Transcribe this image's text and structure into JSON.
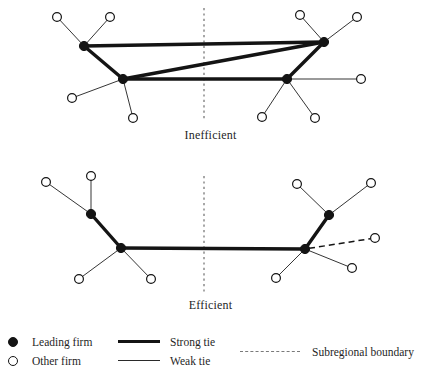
{
  "figure": {
    "panels": [
      {
        "id": "inefficient",
        "label": "Inefficient"
      },
      {
        "id": "efficient",
        "label": "Efficient"
      }
    ]
  },
  "legend": {
    "firms": [
      {
        "symbol": "filled-circle",
        "label": "Leading firm"
      },
      {
        "symbol": "open-circle",
        "label": "Other firm"
      }
    ],
    "ties": [
      {
        "symbol": "thick-line",
        "label": "Strong tie"
      },
      {
        "symbol": "thin-line",
        "label": "Weak tie"
      }
    ],
    "boundary": [
      {
        "symbol": "dashed-line",
        "label": "Subregional boundary"
      }
    ]
  },
  "colors": {
    "ink": "#141414",
    "weak_tie": "#2a2a2a",
    "boundary": "#8a8a8a",
    "background": "#ffffff"
  },
  "diagram_data": {
    "type": "network",
    "panels": [
      {
        "id": "inefficient",
        "title": "Inefficient",
        "boundary": {
          "x": 204,
          "y1": 8,
          "y2": 121,
          "style": "dashed"
        },
        "leading_firms": [
          {
            "id": "L1",
            "x": 84,
            "y": 46
          },
          {
            "id": "L2",
            "x": 123,
            "y": 79
          },
          {
            "id": "L3",
            "x": 324,
            "y": 42
          },
          {
            "id": "L4",
            "x": 287,
            "y": 79
          }
        ],
        "other_firms": [
          {
            "id": "o1",
            "x": 57,
            "y": 17
          },
          {
            "id": "o2",
            "x": 110,
            "y": 17
          },
          {
            "id": "o3",
            "x": 72,
            "y": 98
          },
          {
            "id": "o4",
            "x": 133,
            "y": 118
          },
          {
            "id": "o5",
            "x": 300,
            "y": 15
          },
          {
            "id": "o6",
            "x": 357,
            "y": 17
          },
          {
            "id": "o7",
            "x": 361,
            "y": 79
          },
          {
            "id": "o8",
            "x": 262,
            "y": 117
          },
          {
            "id": "o9",
            "x": 315,
            "y": 118
          }
        ],
        "strong_ties": [
          {
            "from": "L1",
            "to": "L3"
          },
          {
            "from": "L1",
            "to": "L2"
          },
          {
            "from": "L2",
            "to": "L3"
          },
          {
            "from": "L2",
            "to": "L4"
          },
          {
            "from": "L4",
            "to": "L3"
          }
        ],
        "weak_ties": [
          {
            "from": "L1",
            "to": "o1"
          },
          {
            "from": "L1",
            "to": "o2"
          },
          {
            "from": "L2",
            "to": "o3"
          },
          {
            "from": "L2",
            "to": "o4"
          },
          {
            "from": "L3",
            "to": "o5"
          },
          {
            "from": "L3",
            "to": "o6"
          },
          {
            "from": "L4",
            "to": "o7"
          },
          {
            "from": "L4",
            "to": "o8"
          },
          {
            "from": "L4",
            "to": "o9"
          }
        ],
        "dashed_ties": []
      },
      {
        "id": "efficient",
        "title": "Efficient",
        "boundary": {
          "x": 204,
          "y": 1,
          "y1": 176,
          "y2": 292,
          "style": "dashed"
        },
        "leading_firms": [
          {
            "id": "E1",
            "x": 91,
            "y": 214
          },
          {
            "id": "E2",
            "x": 121,
            "y": 248
          },
          {
            "id": "E3",
            "x": 329,
            "y": 215
          },
          {
            "id": "E4",
            "x": 305,
            "y": 249
          }
        ],
        "other_firms": [
          {
            "id": "p1",
            "x": 46,
            "y": 182
          },
          {
            "id": "p2",
            "x": 91,
            "y": 176
          },
          {
            "id": "p3",
            "x": 79,
            "y": 279
          },
          {
            "id": "p4",
            "x": 151,
            "y": 279
          },
          {
            "id": "p5",
            "x": 297,
            "y": 184
          },
          {
            "id": "p6",
            "x": 371,
            "y": 183
          },
          {
            "id": "p7",
            "x": 375,
            "y": 238
          },
          {
            "id": "p8",
            "x": 352,
            "y": 268
          },
          {
            "id": "p9",
            "x": 276,
            "y": 278
          }
        ],
        "strong_ties": [
          {
            "from": "E1",
            "to": "E2"
          },
          {
            "from": "E2",
            "to": "E4"
          },
          {
            "from": "E4",
            "to": "E3"
          }
        ],
        "weak_ties": [
          {
            "from": "E1",
            "to": "p1"
          },
          {
            "from": "E1",
            "to": "p2"
          },
          {
            "from": "E2",
            "to": "p3"
          },
          {
            "from": "E2",
            "to": "p4"
          },
          {
            "from": "E3",
            "to": "p5"
          },
          {
            "from": "E3",
            "to": "p6"
          },
          {
            "from": "E4",
            "to": "p8"
          },
          {
            "from": "E4",
            "to": "p9"
          }
        ],
        "dashed_ties": [
          {
            "from": "E4",
            "to": "p7"
          }
        ]
      }
    ]
  }
}
